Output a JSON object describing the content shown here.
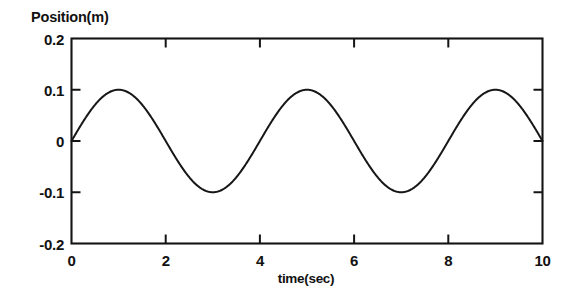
{
  "figure": {
    "background_color": "#ffffff",
    "ink_color": "#141414"
  },
  "chart_data": {
    "type": "line",
    "title": "",
    "ylabel": "Position(m)",
    "xlabel": "time(sec)",
    "xlim": [
      0,
      10
    ],
    "ylim": [
      -0.2,
      0.2
    ],
    "grid": false,
    "legend": false,
    "legend_position": "none",
    "x_ticks": [
      0,
      2,
      4,
      6,
      8,
      10
    ],
    "x_tick_labels": [
      "0",
      "2",
      "4",
      "6",
      "8",
      "10"
    ],
    "y_ticks": [
      -0.2,
      -0.1,
      0,
      0.1,
      0.2
    ],
    "y_tick_labels": [
      "-0.2",
      "-0.1",
      "0",
      "0.1",
      "0.2"
    ],
    "tick_direction": "in",
    "mirrored_ticks": true,
    "series": [
      {
        "name": "position",
        "equation": "y = 0.1*sin(pi*t/2)",
        "amplitude": 0.1,
        "period": 4,
        "phase": 0,
        "color": "#171717",
        "x": [
          0,
          0.25,
          0.5,
          0.75,
          1,
          1.25,
          1.5,
          1.75,
          2,
          2.25,
          2.5,
          2.75,
          3,
          3.25,
          3.5,
          3.75,
          4,
          4.25,
          4.5,
          4.75,
          5,
          5.25,
          5.5,
          5.75,
          6,
          6.25,
          6.5,
          6.75,
          7,
          7.25,
          7.5,
          7.75,
          8,
          8.25,
          8.5,
          8.75,
          9,
          9.25,
          9.5,
          9.75,
          10
        ],
        "values": [
          0,
          0.0383,
          0.0707,
          0.0924,
          0.1,
          0.0924,
          0.0707,
          0.0383,
          0,
          -0.0383,
          -0.0707,
          -0.0924,
          -0.1,
          -0.0924,
          -0.0707,
          -0.0383,
          0,
          0.0383,
          0.0707,
          0.0924,
          0.1,
          0.0924,
          0.0707,
          0.0383,
          0,
          -0.0383,
          -0.0707,
          -0.0924,
          -0.1,
          -0.0924,
          -0.0707,
          -0.0383,
          0,
          0.0383,
          0.0707,
          0.0924,
          0.1,
          0.0924,
          0.0707,
          0.0383,
          0
        ]
      }
    ],
    "annotations": []
  }
}
